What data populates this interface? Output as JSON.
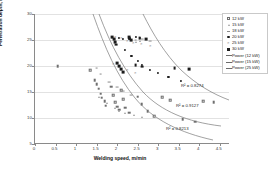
{
  "chart": {
    "type": "scatter",
    "title": "",
    "xlabel": "Welding speed, m/min",
    "ylabel": "Penetration depth, mm",
    "xlim": [
      0,
      4.75
    ],
    "ylim": [
      5,
      30
    ],
    "xticks": [
      "0",
      "0.5",
      "1",
      "1.5",
      "2",
      "2.5",
      "3",
      "3.5",
      "4",
      "4.5"
    ],
    "yticks": [
      "30",
      "25",
      "20",
      "15",
      "10",
      "5"
    ],
    "grid": "horizontal",
    "legend_position": "top-right"
  },
  "legend": {
    "items": [
      {
        "label": "12 kW",
        "marker": "open-square",
        "color": "#6f6f6f"
      },
      {
        "label": "15 kW",
        "marker": "triangle",
        "color": "#9a9a9a"
      },
      {
        "label": "18 kW",
        "marker": "dash",
        "color": "#8a8a8a"
      },
      {
        "label": "20 kW",
        "marker": "dot",
        "color": "#1d1d1d"
      },
      {
        "label": "25 kW",
        "marker": "cross",
        "color": "#777777"
      },
      {
        "label": "30 kW",
        "marker": "filled-square",
        "color": "#1d1d1d"
      },
      {
        "label": "Power (12 kW)",
        "marker": "line",
        "color": "#6b6b6b"
      },
      {
        "label": "Power (15 kW)",
        "marker": "line",
        "color": "#6b6b6b"
      },
      {
        "label": "Power (25 kW)",
        "marker": "line",
        "color": "#6b6b6b"
      }
    ]
  },
  "annotations": [
    {
      "text": "R² = 0.8274",
      "x": 181,
      "y": 84
    },
    {
      "text": "R² = 0.9127",
      "x": 176,
      "y": 104
    },
    {
      "text": "R² = 0.8213",
      "x": 166,
      "y": 127
    }
  ],
  "chart_data": {
    "type": "scatter",
    "title": "",
    "xlabel": "Welding speed, m/min",
    "ylabel": "Penetration depth, mm",
    "xlim": [
      0,
      4.75
    ],
    "ylim": [
      5,
      30
    ],
    "grid": true,
    "legend_position": "top-right",
    "series": [
      {
        "name": "12 kW",
        "marker": "open-square",
        "points": [
          [
            0.55,
            20.0
          ],
          [
            1.35,
            19.2
          ],
          [
            1.45,
            17.3
          ],
          [
            1.5,
            16.5
          ],
          [
            1.55,
            15.6
          ],
          [
            1.6,
            14.7
          ],
          [
            1.62,
            13.9
          ],
          [
            1.7,
            13.2
          ],
          [
            1.72,
            12.4
          ],
          [
            1.85,
            16.0
          ],
          [
            1.9,
            14.4
          ],
          [
            1.95,
            13.0
          ],
          [
            2.0,
            12.2
          ],
          [
            2.05,
            11.6
          ],
          [
            2.1,
            15.3
          ],
          [
            2.15,
            13.6
          ],
          [
            2.2,
            12.0
          ],
          [
            2.3,
            11.0
          ],
          [
            2.5,
            14.1
          ],
          [
            2.6,
            12.6
          ],
          [
            2.75,
            11.3
          ],
          [
            2.9,
            10.4
          ],
          [
            3.1,
            14.0
          ],
          [
            3.3,
            13.4
          ],
          [
            3.6,
            9.8
          ],
          [
            3.9,
            9.3
          ],
          [
            4.1,
            13.2
          ],
          [
            4.35,
            13.0
          ]
        ]
      },
      {
        "name": "15 kW",
        "marker": "triangle",
        "points": [
          [
            1.55,
            14.0
          ],
          [
            1.75,
            12.9
          ],
          [
            1.95,
            12.0
          ],
          [
            2.05,
            11.4
          ],
          [
            2.2,
            10.9
          ],
          [
            2.4,
            10.5
          ],
          [
            2.6,
            10.1
          ],
          [
            2.45,
            24.7
          ],
          [
            2.55,
            24.9
          ]
        ]
      },
      {
        "name": "18 kW",
        "marker": "dash",
        "points": [
          [
            1.5,
            19.6
          ],
          [
            1.6,
            18.5
          ],
          [
            1.8,
            17.0
          ],
          [
            2.0,
            15.9
          ],
          [
            2.15,
            15.1
          ],
          [
            2.35,
            14.4
          ],
          [
            2.45,
            25.0
          ],
          [
            2.6,
            25.1
          ],
          [
            2.8,
            24.9
          ]
        ]
      },
      {
        "name": "20 kW",
        "marker": "dot",
        "points": [
          [
            2.05,
            25.4
          ],
          [
            2.15,
            25.2
          ],
          [
            2.3,
            25.3
          ],
          [
            2.45,
            25.5
          ],
          [
            2.55,
            25.4
          ],
          [
            2.7,
            25.2
          ],
          [
            2.2,
            23.0
          ],
          [
            2.35,
            22.0
          ],
          [
            2.5,
            21.0
          ],
          [
            2.6,
            20.2
          ],
          [
            2.8,
            19.3
          ],
          [
            3.0,
            18.6
          ],
          [
            3.25,
            17.9
          ],
          [
            3.55,
            17.2
          ]
        ]
      },
      {
        "name": "25 kW",
        "marker": "cross",
        "points": [
          [
            1.95,
            25.5
          ],
          [
            2.1,
            25.3
          ],
          [
            2.25,
            24.8
          ],
          [
            2.4,
            24.5
          ],
          [
            2.6,
            24.2
          ],
          [
            2.8,
            23.8
          ],
          [
            1.9,
            20.4
          ],
          [
            2.05,
            19.8
          ],
          [
            2.25,
            19.2
          ],
          [
            2.45,
            18.7
          ]
        ]
      },
      {
        "name": "30 kW",
        "marker": "filled-square",
        "points": [
          [
            1.88,
            25.6
          ],
          [
            1.92,
            25.1
          ],
          [
            1.95,
            24.6
          ],
          [
            1.98,
            24.1
          ],
          [
            2.3,
            25.5
          ],
          [
            2.35,
            25.0
          ],
          [
            2.55,
            25.4
          ],
          [
            2.7,
            25.2
          ],
          [
            2.0,
            20.5
          ],
          [
            2.05,
            20.0
          ],
          [
            2.1,
            19.4
          ],
          [
            2.15,
            18.8
          ],
          [
            2.45,
            20.2
          ],
          [
            2.6,
            19.9
          ],
          [
            3.4,
            19.6
          ],
          [
            3.75,
            19.4
          ]
        ]
      }
    ],
    "trendlines": [
      {
        "name": "Power (12 kW)",
        "r2": "0.8274",
        "type": "power"
      },
      {
        "name": "Power (15 kW)",
        "r2": "0.9127",
        "type": "power"
      },
      {
        "name": "Power (25 kW)",
        "r2": "0.8213",
        "type": "power"
      }
    ]
  }
}
